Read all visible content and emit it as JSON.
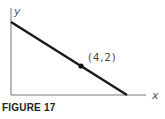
{
  "figure": {
    "caption": "FIGURE 17",
    "x_axis_label": "x",
    "y_axis_label": "y",
    "point": {
      "x": 4,
      "y": 2,
      "label": "(4,2)"
    },
    "line": {
      "description": "line with negative slope passing through (4,2), intersecting both axes in the first quadrant"
    },
    "colors": {
      "line": "#1a1a1a",
      "axes": "#666666"
    }
  }
}
